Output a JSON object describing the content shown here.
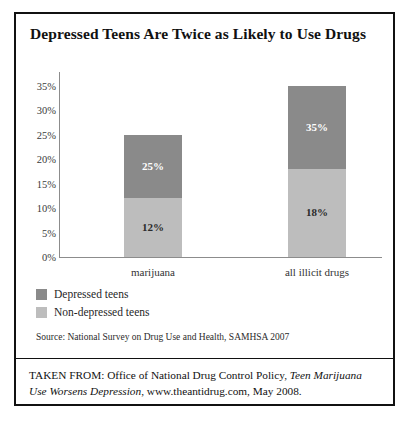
{
  "chart_data": {
    "type": "bar",
    "title": "Depressed Teens Are Twice as Likely to Use Drugs",
    "xlabel": "",
    "ylabel": "",
    "ylim": [
      0,
      35
    ],
    "ytick_labels": [
      "0%",
      "5%",
      "10%",
      "15%",
      "20%",
      "25%",
      "30%",
      "35%"
    ],
    "ytick_values": [
      0,
      5,
      10,
      15,
      20,
      25,
      30,
      35
    ],
    "grid": false,
    "legend_position": "below-left",
    "categories": [
      "marijuana",
      "all illicit drugs"
    ],
    "series": [
      {
        "name": "Depressed teens",
        "color": "#8a8a8a",
        "values": [
          25,
          35
        ],
        "labels": [
          "25%",
          "35%"
        ]
      },
      {
        "name": "Non-depressed teens",
        "color": "#bdbdbd",
        "values": [
          12,
          18
        ],
        "labels": [
          "12%",
          "18%"
        ]
      }
    ]
  },
  "source": {
    "text": "Source: National Survey on Drug Use and Health, SAMHSA 2007"
  },
  "footer": {
    "prefix": "TAKEN FROM: Office of National Drug Control Policy, ",
    "italic_title": "Teen Marijuana Use Worsens Depression",
    "suffix": ", www.theantidrug.com, May 2008."
  }
}
